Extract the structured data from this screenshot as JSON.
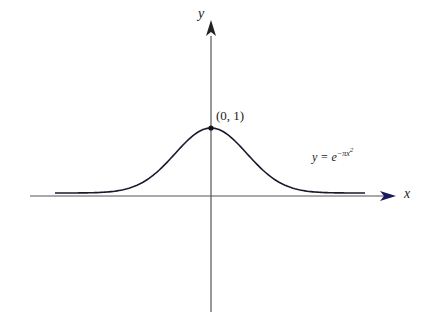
{
  "figure": {
    "x_axis_label": "x",
    "y_axis_label": "y",
    "point_label": "(0, 1)",
    "curve_label_prefix": "y = e",
    "curve_label_exponent": "−πx",
    "curve_label_power": "2",
    "colors": {
      "curve": "#1a1a2e",
      "axis": "#555555",
      "x_arrow": "#1a1a5e"
    }
  },
  "chart_data": {
    "type": "line",
    "title": "",
    "function": "y = e^(-pi x^2)",
    "xlabel": "x",
    "ylabel": "y",
    "annotations": [
      {
        "point": [
          0,
          1
        ],
        "text": "(0, 1)"
      }
    ],
    "x": [
      -1.7,
      -1.2,
      -0.9,
      -0.68,
      -0.5,
      -0.3,
      0,
      0.3,
      0.5,
      0.68,
      0.9,
      1.2,
      1.7
    ],
    "values": [
      0.0001,
      0.011,
      0.078,
      0.235,
      0.456,
      0.754,
      1,
      0.754,
      0.456,
      0.235,
      0.078,
      0.011,
      0.0001
    ],
    "grid": false
  }
}
